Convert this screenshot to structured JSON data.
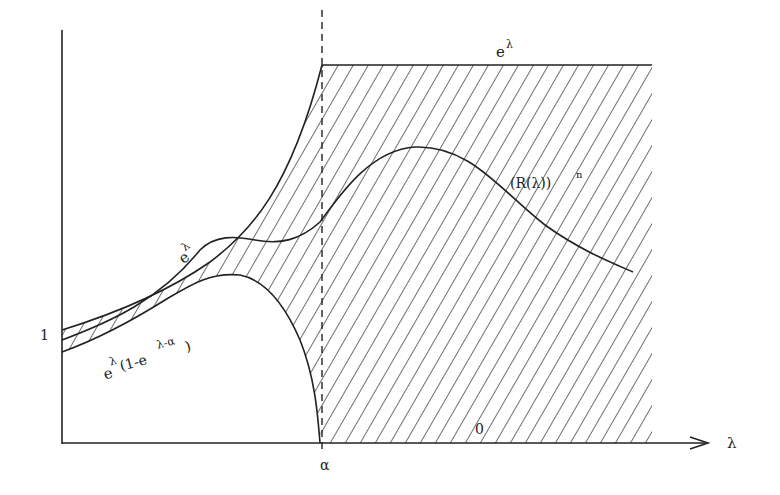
{
  "figure": {
    "type": "mathematical-diagram",
    "axes": {
      "x_label": "λ",
      "y_tick_label": "1",
      "x_tick_label": "α"
    },
    "curves": {
      "upper_bound_label": "eλ",
      "upper_bound_base": "e",
      "upper_bound_sup": "λ",
      "upper_bound_left_label_base": "e",
      "upper_bound_left_label_sup": "λ",
      "lower_bound_label_base": "e",
      "lower_bound_label_sup": "λ",
      "lower_bound_label_rest": "(1-e",
      "lower_bound_label_sup2": "λ-α",
      "lower_bound_label_close": ")",
      "function_label": "(R(λ))",
      "function_label_sup": "n",
      "zero_label": "0"
    },
    "colors": {
      "ink": "#222222",
      "background": "#ffffff"
    }
  }
}
